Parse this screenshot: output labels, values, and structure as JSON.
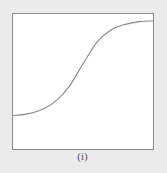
{
  "figure": {
    "caption": "(i)",
    "colors": {
      "background": "#ebebeb",
      "panel": "#ffffff",
      "frame": "#8a8a8a",
      "curve": "#8a8a8a"
    }
  },
  "chart_data": {
    "type": "line",
    "title": "",
    "xlabel": "",
    "ylabel": "",
    "xlim": [
      0,
      1
    ],
    "ylim": [
      0,
      1
    ],
    "grid": false,
    "series": [
      {
        "name": "sigmoid",
        "x": [
          0,
          0.1,
          0.2,
          0.3,
          0.4,
          0.5,
          0.6,
          0.7,
          0.8,
          0.9,
          1.0
        ],
        "y": [
          0.25,
          0.26,
          0.29,
          0.35,
          0.46,
          0.63,
          0.79,
          0.88,
          0.92,
          0.94,
          0.945
        ]
      }
    ]
  }
}
